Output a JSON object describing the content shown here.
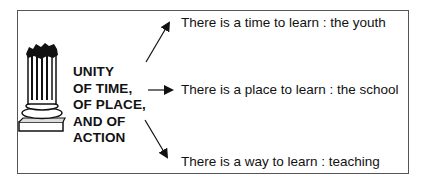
{
  "concept": {
    "lines": [
      "UNITY",
      "OF TIME,",
      "OF PLACE,",
      "AND OF",
      "ACTION"
    ]
  },
  "statements": [
    {
      "text": "There is a time to learn : the youth",
      "arrow": "up-right"
    },
    {
      "text": "There is a place to learn : the school",
      "arrow": "right"
    },
    {
      "text": "There is a way to learn : teaching",
      "arrow": "down-right"
    }
  ],
  "icons": {
    "column": "broken-greek-column-icon"
  },
  "colors": {
    "ink": "#111111",
    "border": "#555555"
  }
}
